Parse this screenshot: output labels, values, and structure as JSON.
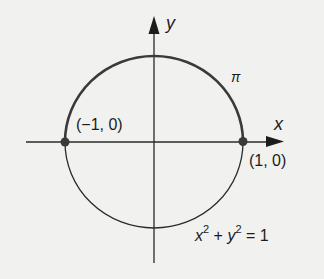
{
  "diagram": {
    "axes": {
      "x_label": "x",
      "y_label": "y"
    },
    "points": [
      {
        "label": "(−1, 0)",
        "x": -1,
        "y": 0
      },
      {
        "label": "(1, 0)",
        "x": 1,
        "y": 0
      }
    ],
    "arc_label": "π",
    "equation": {
      "x": "x",
      "plus": "+",
      "y": "y",
      "exp": "2",
      "equals": "= 1",
      "full": "x² + y² = 1"
    },
    "colors": {
      "background": "#f1f1f0",
      "stroke": "#2a2a2a",
      "point": "#3a3a3a"
    }
  }
}
